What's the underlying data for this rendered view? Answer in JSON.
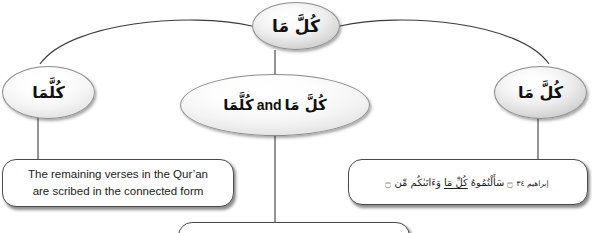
{
  "diagram": {
    "type": "tree",
    "title_node": {
      "id": "kulla-ma-root",
      "text": "كُلَّ مَا"
    },
    "branches": [
      {
        "id": "connected-form",
        "ellipse_text": "كُلَّمَا",
        "box_text_line1": "The remaining verses in the Qur’an",
        "box_text_line2": "are scribed in the connected form"
      },
      {
        "id": "both-forms",
        "ellipse_arabic_1": "كُلَّمَا",
        "ellipse_conjunction": "and",
        "ellipse_arabic_2": "كُلَّ مَا"
      },
      {
        "id": "separated-form",
        "ellipse_text": "كُلَّ مَا",
        "verse": {
          "open_bracket": "۝",
          "part_before": "وَءَاتَىٰكُم مِّن",
          "highlighted": "كُلِّ مَا",
          "part_after": "سَأَلْتُمُوهُ",
          "close_bracket": "۝",
          "reference": "إبراهيم ٣٤"
        }
      }
    ],
    "colors": {
      "background": "#ffffff",
      "node_border": "#8d8d8d",
      "box_border": "#4a4a4a",
      "connector": "#3c3c3c",
      "text": "#101010"
    }
  }
}
